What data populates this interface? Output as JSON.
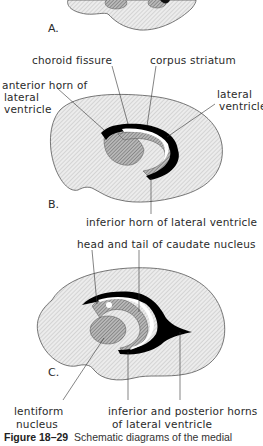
{
  "figure": {
    "number": "Figure 18–29",
    "caption": "Schematic diagrams of the medial"
  },
  "panels": [
    {
      "letter": "A."
    },
    {
      "letter": "B.",
      "labels": {
        "choroid_fissure": "choroid fissure",
        "corpus_striatum": "corpus striatum",
        "anterior_horn_1": "anterior horn of",
        "anterior_horn_2": "lateral",
        "anterior_horn_3": "ventricle",
        "lateral_ventricle_1": "lateral",
        "lateral_ventricle_2": "ventricle",
        "inferior_horn": "inferior horn of lateral ventricle"
      }
    },
    {
      "letter": "C.",
      "labels": {
        "caudate": "head and tail of caudate nucleus",
        "lentiform_1": "lentiform",
        "lentiform_2": "nucleus",
        "horns_1": "inferior and posterior horns",
        "horns_2": "of lateral ventricle"
      }
    }
  ],
  "colors": {
    "hemisphere_fill": "#e4e4e4",
    "nucleus_fill": "#9a9a9a",
    "ventricle": "#000000",
    "outline": "#444444"
  }
}
